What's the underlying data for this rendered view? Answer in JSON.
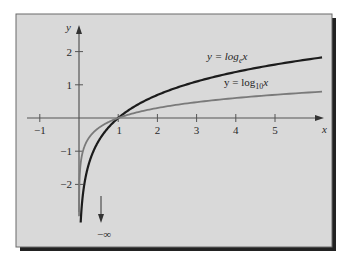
{
  "chart_data": {
    "type": "line",
    "title": "",
    "xlabel": "x",
    "ylabel": "y",
    "xlim": [
      -1.35,
      6.2
    ],
    "ylim": [
      -3.2,
      2.55
    ],
    "grid": false,
    "x_ticks": [
      -1,
      1,
      2,
      3,
      4,
      5
    ],
    "x_tick_labels": [
      "−1",
      "1",
      "2",
      "3",
      "4",
      "5"
    ],
    "y_ticks": [
      2,
      1,
      -1,
      -2
    ],
    "y_tick_labels": [
      "2",
      "1",
      "−1",
      "−2"
    ],
    "series": [
      {
        "name": "y = log_e x",
        "label_prefix": "y = log",
        "label_sub": "e",
        "label_var": "x",
        "base": 2.718281828,
        "x_domain": [
          0.043,
          6.2
        ],
        "color": "#1c1c1c",
        "sample_points": [
          [
            0.05,
            -3.0
          ],
          [
            0.1,
            -2.3
          ],
          [
            0.25,
            -1.39
          ],
          [
            0.5,
            -0.69
          ],
          [
            1,
            0
          ],
          [
            2,
            0.69
          ],
          [
            3,
            1.1
          ],
          [
            4,
            1.39
          ],
          [
            5,
            1.61
          ],
          [
            6.2,
            1.82
          ]
        ]
      },
      {
        "name": "y = log10 x",
        "label_prefix": "y = log",
        "label_sub": "10",
        "label_var": "x",
        "base": 10,
        "x_domain": [
          0.0011,
          6.2
        ],
        "color": "#7a7a7a",
        "sample_points": [
          [
            0.001,
            -3.0
          ],
          [
            0.01,
            -2.0
          ],
          [
            0.1,
            -1.0
          ],
          [
            0.5,
            -0.3
          ],
          [
            1,
            0
          ],
          [
            2,
            0.3
          ],
          [
            3,
            0.48
          ],
          [
            4,
            0.6
          ],
          [
            5,
            0.7
          ],
          [
            6.2,
            0.79
          ]
        ]
      }
    ],
    "annotations": [
      {
        "text": "−∞",
        "meaning": "curves approach negative infinity as x → 0+",
        "arrow": "down"
      }
    ]
  },
  "colors": {
    "panel_background": "#d9d9d9",
    "panel_border": "#555555",
    "shadow": "#222222",
    "axis": "#555555"
  }
}
